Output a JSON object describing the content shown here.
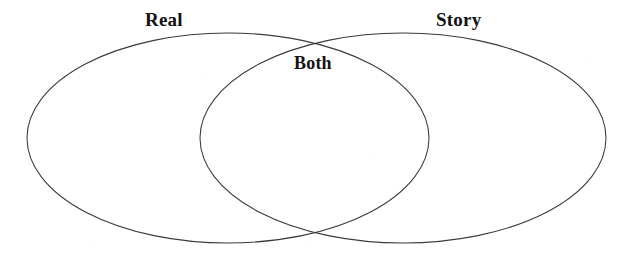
{
  "page": {
    "width": 631,
    "height": 266,
    "background_color": "#ffffff",
    "stroke_color": "#3a3a3a",
    "text_color": "#121212"
  },
  "diagram": {
    "type": "venn",
    "set_count": 2,
    "left_label": "Real",
    "right_label": "Story",
    "overlap_label": "Both",
    "left_ellipse": {
      "label": "Real",
      "cx": 228,
      "cy": 138,
      "rx": 201,
      "ry": 105
    },
    "right_ellipse": {
      "label": "Story",
      "cx": 403,
      "cy": 138,
      "rx": 203,
      "ry": 105
    },
    "intersection_points": {
      "top": {
        "x": 315,
        "y": 40
      },
      "bottom": {
        "x": 315,
        "y": 237
      }
    },
    "label_positions": {
      "left": {
        "x": 145,
        "y": 10
      },
      "right": {
        "x": 436,
        "y": 10
      },
      "overlap": {
        "x": 294,
        "y": 54
      }
    }
  }
}
